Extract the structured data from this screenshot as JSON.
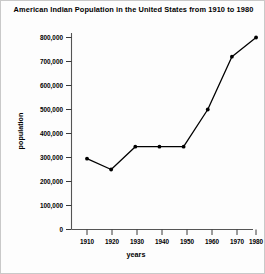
{
  "chart_data": {
    "type": "line",
    "title": "American Indian Population in the United States from 1910 to 1980",
    "xlabel": "years",
    "ylabel": "population",
    "x": [
      1910,
      1920,
      1930,
      1940,
      1950,
      1960,
      1970,
      1980
    ],
    "values": [
      295000,
      250000,
      345000,
      345000,
      345000,
      500000,
      720000,
      800000
    ],
    "xtick_labels": [
      "1910",
      "1920",
      "1930",
      "1940",
      "1950",
      "1960",
      "1970",
      "1980"
    ],
    "ytick_labels": [
      "0",
      "100,000",
      "200,000",
      "300,000",
      "400,000",
      "500,000",
      "600,000",
      "700,000",
      "800,000"
    ],
    "ytick_values": [
      0,
      100000,
      200000,
      300000,
      400000,
      500000,
      600000,
      700000,
      800000
    ],
    "xlim": [
      1905,
      1985
    ],
    "ylim": [
      0,
      800000
    ],
    "grid": false,
    "legend": false,
    "marker": "dot",
    "line_color": "#000000",
    "background_color": "#fdfdfd"
  }
}
